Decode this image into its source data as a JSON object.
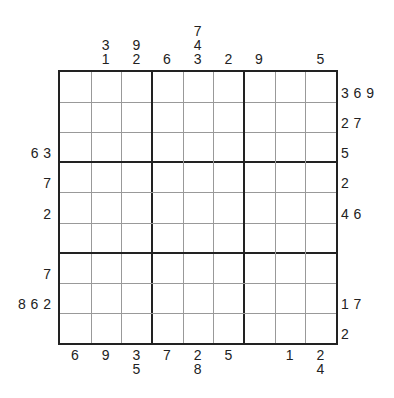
{
  "puzzle": {
    "type": "sudoku-outside-clues",
    "size": 9,
    "top_clues": [
      [],
      [
        "3",
        "1"
      ],
      [
        "9",
        "2"
      ],
      [
        "6"
      ],
      [
        "7",
        "4",
        "3"
      ],
      [
        "2"
      ],
      [
        "9"
      ],
      [],
      [
        "5"
      ]
    ],
    "bottom_clues": [
      [
        "6"
      ],
      [
        "9"
      ],
      [
        "3",
        "5"
      ],
      [
        "7"
      ],
      [
        "2",
        "8"
      ],
      [
        "5"
      ],
      [],
      [
        "1"
      ],
      [
        "2",
        "4"
      ]
    ],
    "left_clues": [
      "",
      "",
      "63",
      "7",
      "2",
      "",
      "7",
      "862",
      ""
    ],
    "right_clues": [
      "369",
      "27",
      "5",
      "2",
      "46",
      "",
      "",
      "17",
      "2"
    ],
    "cells": [
      [
        "",
        "",
        "",
        "",
        "",
        "",
        "",
        "",
        ""
      ],
      [
        "",
        "",
        "",
        "",
        "",
        "",
        "",
        "",
        ""
      ],
      [
        "",
        "",
        "",
        "",
        "",
        "",
        "",
        "",
        ""
      ],
      [
        "",
        "",
        "",
        "",
        "",
        "",
        "",
        "",
        ""
      ],
      [
        "",
        "",
        "",
        "",
        "",
        "",
        "",
        "",
        ""
      ],
      [
        "",
        "",
        "",
        "",
        "",
        "",
        "",
        "",
        ""
      ],
      [
        "",
        "",
        "",
        "",
        "",
        "",
        "",
        "",
        ""
      ],
      [
        "",
        "",
        "",
        "",
        "",
        "",
        "",
        "",
        ""
      ],
      [
        "",
        "",
        "",
        "",
        "",
        "",
        "",
        "",
        ""
      ]
    ]
  },
  "colors": {
    "line": "#222222",
    "thin_line": "#999999",
    "text": "#222222"
  }
}
